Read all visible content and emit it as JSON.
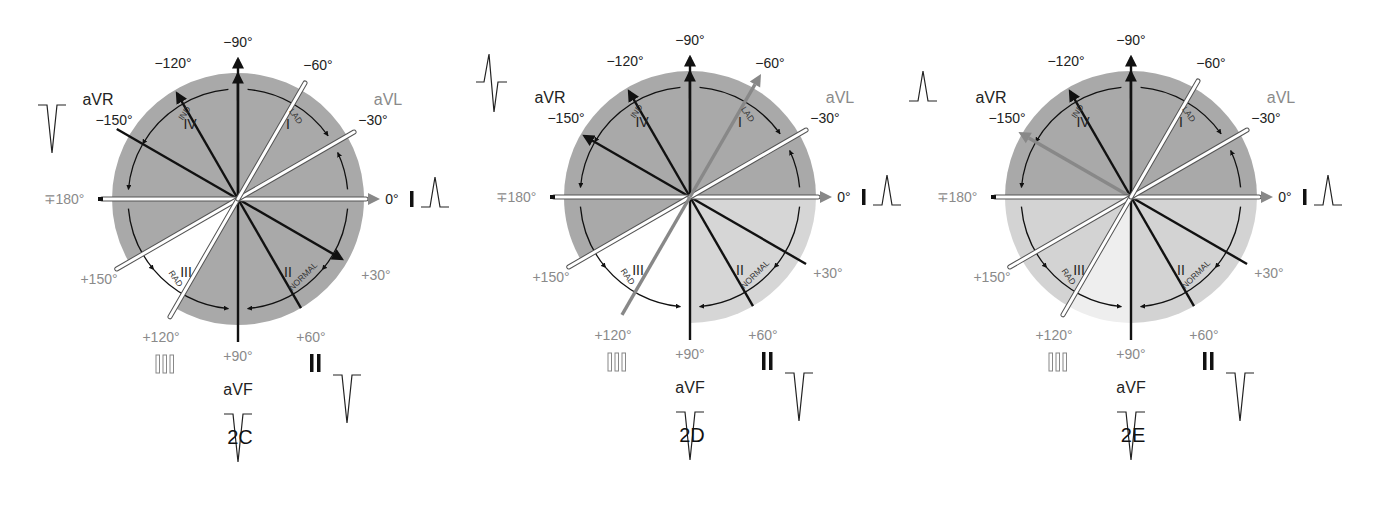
{
  "figure": {
    "colors": {
      "dark_gray": "#9f9f9f",
      "mid_gray": "#b4b4b4",
      "light_gray": "#d4d4d4",
      "lightest": "#e8e8e8",
      "white": "#ffffff",
      "black": "#111111",
      "label_gray": "#8a8a8a",
      "arrow_gray": "#888888"
    },
    "arc_labels": {
      "ind": "IND",
      "lad": "LAD",
      "rad": "RAD",
      "normal": "NORMAL"
    },
    "quadrant_labels": [
      "I",
      "II",
      "III",
      "IV"
    ],
    "angle_labels": {
      "m90": "−90°",
      "m120": "−120°",
      "m60": "−60°",
      "m150": "−150°",
      "m30": "−30°",
      "p180": "∓180°",
      "zero": "0°",
      "p150": "+150°",
      "p30": "+30°",
      "p120": "+120°",
      "p60": "+60°",
      "p90": "+90°"
    },
    "lead_labels": {
      "aVR": "aVR",
      "aVL": "aVL",
      "I": "I",
      "II": "II",
      "III": "III",
      "aVF": "aVF"
    },
    "panels": [
      {
        "id": "2C",
        "caption": "2C",
        "center": [
          238,
          199
        ],
        "shading": [
          {
            "from": -180,
            "to": 120,
            "color": "#a9a9a9"
          },
          {
            "from": 120,
            "to": 150,
            "color": "#ffffff"
          },
          {
            "from": 150,
            "to": 180,
            "color": "#a9a9a9"
          }
        ],
        "axis_arrow": {
          "angle": 30,
          "style": "black"
        },
        "waveforms": {
          "aVR": "negative",
          "I": "positive",
          "II": "negative",
          "aVF": "negative"
        }
      },
      {
        "id": "2D",
        "caption": "2D",
        "center": [
          690,
          197
        ],
        "shading": [
          {
            "from": -180,
            "to": 0,
            "color": "#a9a9a9"
          },
          {
            "from": 0,
            "to": 90,
            "color": "#d6d6d6"
          },
          {
            "from": 90,
            "to": 150,
            "color": "#ffffff"
          },
          {
            "from": 150,
            "to": 180,
            "color": "#a9a9a9"
          }
        ],
        "axis_arrow": {
          "angle": -60,
          "style": "gray"
        },
        "waveforms": {
          "aVR": "biphasic",
          "I": "positive",
          "II": "negative",
          "aVF": "negative"
        }
      },
      {
        "id": "2E",
        "caption": "2E",
        "center": [
          1131,
          197
        ],
        "shading": [
          {
            "from": -180,
            "to": 0,
            "color": "#a9a9a9"
          },
          {
            "from": 0,
            "to": 90,
            "color": "#d3d3d3"
          },
          {
            "from": 90,
            "to": 120,
            "color": "#eeeeee"
          },
          {
            "from": 120,
            "to": 180,
            "color": "#d3d3d3"
          }
        ],
        "axis_arrow": {
          "angle": -150,
          "style": "gray"
        },
        "waveforms": {
          "aVR": "positive",
          "I": "positive",
          "II": "negative",
          "aVF": "negative"
        }
      }
    ]
  }
}
